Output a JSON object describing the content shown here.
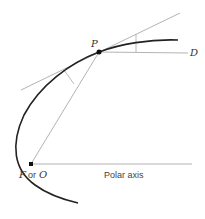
{
  "diagram": {
    "labels": {
      "point_p": "P",
      "point_d": "D",
      "focus_f": "F",
      "or_text": "or",
      "origin_o": "O",
      "polar_axis": "Polar axis"
    },
    "colors": {
      "curve": "#222222",
      "thin_lines": "#aaaaaa",
      "points": "#111111",
      "background": "#ffffff"
    },
    "points": {
      "P": [
        99,
        52
      ],
      "F": [
        31,
        164
      ],
      "D_line_end": [
        188,
        53
      ]
    }
  }
}
